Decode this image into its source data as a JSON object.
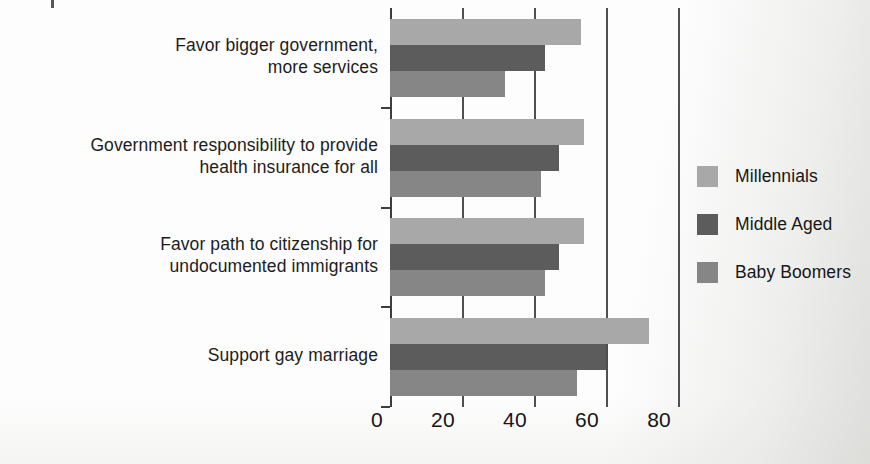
{
  "chart_data": {
    "type": "bar",
    "orientation": "horizontal",
    "title": "",
    "subtitle": "",
    "xlabel": "",
    "ylabel": "",
    "xlim": [
      0,
      83.3
    ],
    "xticks": [
      0,
      20,
      40,
      60,
      80
    ],
    "xtick_labels": [
      "0",
      "20",
      "40",
      "60",
      "80"
    ],
    "grid": true,
    "grid_axis": "x",
    "legend_position": "right",
    "categories": [
      "Favor bigger government,\nmore services",
      "Government responsibility to provide\nhealth insurance for all",
      "Favor path to citizenship for\nundocumented immigrants",
      "Support gay marriage"
    ],
    "category_lines": [
      [
        "Favor bigger government,",
        "more services"
      ],
      [
        "Government responsibility to provide",
        "health insurance for all"
      ],
      [
        "Favor path to citizenship for",
        "undocumented immigrants"
      ],
      [
        "Support gay marriage"
      ]
    ],
    "series": [
      {
        "name": "Millennials",
        "color": "#a8a8a8",
        "values": [
          53,
          54,
          54,
          72
        ]
      },
      {
        "name": "Middle Aged",
        "color": "#5c5c5c",
        "values": [
          43,
          47,
          47,
          60
        ]
      },
      {
        "name": "Baby Boomers",
        "color": "#868686",
        "values": [
          32,
          42,
          43,
          52
        ]
      }
    ]
  },
  "legend": {
    "items": [
      {
        "label": "Millennials",
        "color": "#a8a8a8"
      },
      {
        "label": "Middle Aged",
        "color": "#5c5c5c"
      },
      {
        "label": "Baby Boomers",
        "color": "#868686"
      }
    ]
  },
  "colors": {
    "millennials": "#a8a8a8",
    "middle_aged": "#5c5c5c",
    "baby_boomers": "#868686",
    "axis": "#3d3d3d",
    "text": "#161616",
    "background": "#fdfdfd"
  }
}
